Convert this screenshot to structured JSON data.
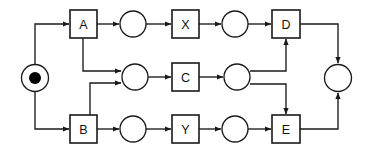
{
  "diagram": {
    "type": "petri-net",
    "canvas": {
      "width": 367,
      "height": 155
    },
    "colors": {
      "background": "#ffffff",
      "stroke": "#1a1a1a",
      "token": "#000000",
      "box_fill": "#ffffff",
      "label": "#111111"
    },
    "places": [
      {
        "id": "p_start",
        "name": "start-place",
        "cx": 35,
        "cy": 78,
        "r": 13.5,
        "token": true,
        "token_r": 6
      },
      {
        "id": "p_a_out",
        "name": "place-after-a",
        "cx": 133,
        "cy": 24,
        "r": 13,
        "token": false
      },
      {
        "id": "p_x_out",
        "name": "place-after-x",
        "cx": 235,
        "cy": 24,
        "r": 13,
        "token": false
      },
      {
        "id": "p_mid_in",
        "name": "place-before-c",
        "cx": 135,
        "cy": 77,
        "r": 13,
        "token": false
      },
      {
        "id": "p_c_out",
        "name": "place-after-c",
        "cx": 237,
        "cy": 77,
        "r": 13,
        "token": false
      },
      {
        "id": "p_b_out",
        "name": "place-after-b",
        "cx": 133,
        "cy": 129,
        "r": 13,
        "token": false
      },
      {
        "id": "p_y_out",
        "name": "place-after-y",
        "cx": 235,
        "cy": 129,
        "r": 13,
        "token": false
      },
      {
        "id": "p_end",
        "name": "end-place",
        "cx": 338,
        "cy": 78,
        "r": 13.5,
        "token": false
      }
    ],
    "transitions": [
      {
        "id": "t_a",
        "name": "transition-a",
        "label": "A",
        "x": 70,
        "y": 10,
        "w": 27,
        "h": 28
      },
      {
        "id": "t_x",
        "name": "transition-x",
        "label": "X",
        "x": 172,
        "y": 10,
        "w": 27,
        "h": 28
      },
      {
        "id": "t_d",
        "name": "transition-d",
        "label": "D",
        "x": 272,
        "y": 10,
        "w": 28,
        "h": 28
      },
      {
        "id": "t_c",
        "name": "transition-c",
        "label": "C",
        "x": 172,
        "y": 63,
        "w": 27,
        "h": 28
      },
      {
        "id": "t_b",
        "name": "transition-b",
        "label": "B",
        "x": 70,
        "y": 115,
        "w": 27,
        "h": 28
      },
      {
        "id": "t_y",
        "name": "transition-y",
        "label": "Y",
        "x": 172,
        "y": 115,
        "w": 27,
        "h": 28
      },
      {
        "id": "t_e",
        "name": "transition-e",
        "label": "E",
        "x": 272,
        "y": 115,
        "w": 28,
        "h": 28
      }
    ],
    "arcs": [
      {
        "id": "arc_start_a",
        "name": "arc-start-to-a",
        "from": "p_start",
        "to": "t_a"
      },
      {
        "id": "arc_start_b",
        "name": "arc-start-to-b",
        "from": "p_start",
        "to": "t_b"
      },
      {
        "id": "arc_a_pa",
        "name": "arc-a-to-place",
        "from": "t_a",
        "to": "p_a_out"
      },
      {
        "id": "arc_pa_x",
        "name": "arc-place-to-x",
        "from": "p_a_out",
        "to": "t_x"
      },
      {
        "id": "arc_x_px",
        "name": "arc-x-to-place",
        "from": "t_x",
        "to": "p_x_out"
      },
      {
        "id": "arc_px_d",
        "name": "arc-place-to-d",
        "from": "p_x_out",
        "to": "t_d"
      },
      {
        "id": "arc_a_mid",
        "name": "arc-a-to-mid-place",
        "from": "t_a",
        "to": "p_mid_in"
      },
      {
        "id": "arc_b_mid",
        "name": "arc-b-to-mid-place",
        "from": "t_b",
        "to": "p_mid_in"
      },
      {
        "id": "arc_mid_c",
        "name": "arc-place-to-c",
        "from": "p_mid_in",
        "to": "t_c"
      },
      {
        "id": "arc_c_pc",
        "name": "arc-c-to-place",
        "from": "t_c",
        "to": "p_c_out"
      },
      {
        "id": "arc_pc_d",
        "name": "arc-place-to-d-up",
        "from": "p_c_out",
        "to": "t_d"
      },
      {
        "id": "arc_pc_e",
        "name": "arc-place-to-e-down",
        "from": "p_c_out",
        "to": "t_e"
      },
      {
        "id": "arc_b_pb",
        "name": "arc-b-to-place",
        "from": "t_b",
        "to": "p_b_out"
      },
      {
        "id": "arc_pb_y",
        "name": "arc-place-to-y",
        "from": "p_b_out",
        "to": "t_y"
      },
      {
        "id": "arc_y_py",
        "name": "arc-y-to-place",
        "from": "t_y",
        "to": "p_y_out"
      },
      {
        "id": "arc_py_e",
        "name": "arc-place-to-e",
        "from": "p_y_out",
        "to": "t_e"
      },
      {
        "id": "arc_d_end",
        "name": "arc-d-to-end",
        "from": "t_d",
        "to": "p_end"
      },
      {
        "id": "arc_e_end",
        "name": "arc-e-to-end",
        "from": "t_e",
        "to": "p_end"
      }
    ]
  }
}
